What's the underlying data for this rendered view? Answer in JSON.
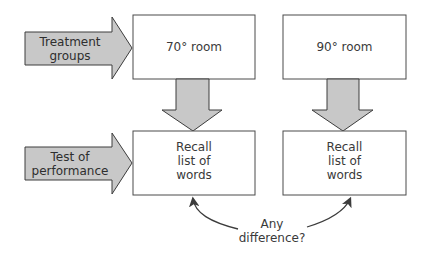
{
  "diagram": {
    "row_labels": {
      "treatment": {
        "line1": "Treatment",
        "line2": "groups"
      },
      "test": {
        "line1": "Test of",
        "line2": "performance"
      }
    },
    "conditions": [
      {
        "label": "70° room",
        "outcome": {
          "line1": "Recall",
          "line2": "list of",
          "line3": "words"
        }
      },
      {
        "label": "90° room",
        "outcome": {
          "line1": "Recall",
          "line2": "list of",
          "line3": "words"
        }
      }
    ],
    "comparison": {
      "line1": "Any",
      "line2": "difference?"
    },
    "colors": {
      "arrow_fill": "#c8c8c8",
      "stroke": "#3c3c3c",
      "box_fill": "#ffffff"
    }
  }
}
